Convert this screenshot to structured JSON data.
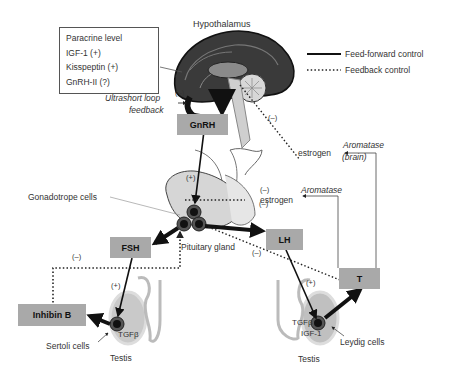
{
  "title": "Hypothalamus",
  "paracrine_box": {
    "heading": "Paracrine level",
    "items": [
      "IGF-1 (+)",
      "Kisspeptin (+)",
      "GnRH-II (?)"
    ]
  },
  "legend": {
    "feed_forward": "Feed-forward control",
    "feedback": "Feedback control"
  },
  "labels": {
    "ultrashort_line1": "Ultrashort loop",
    "ultrashort_line2": "feedback",
    "gnrh": "GnRH",
    "fsh": "FSH",
    "lh": "LH",
    "t": "T",
    "inhibin_b": "Inhibin B",
    "estrogen_brain": "estrogen",
    "aromatase_brain_line1": "Aromatase",
    "aromatase_brain_line2": "(brain)",
    "estrogen_pituitary": "estrogen",
    "aromatase_pituitary": "Aromatase",
    "gonadotrope_cells": "Gonadotrope cells",
    "pituitary_gland": "Pituitary gland",
    "sertoli_cells": "Sertoli cells",
    "leydig_cells": "Leydig cells",
    "testis_left": "Testis",
    "testis_right": "Testis",
    "tgfb_left": "TGFβ",
    "tgfb_right": "TGFβ",
    "igf1_right": "IGF-1"
  },
  "signs": {
    "minus": "(–)",
    "plus": "(+)"
  },
  "colors": {
    "box_fill": "#a9a9a9",
    "arrow": "#111111",
    "brain_dark": "#2a2a2a",
    "tissue": "#c8c8c8"
  }
}
